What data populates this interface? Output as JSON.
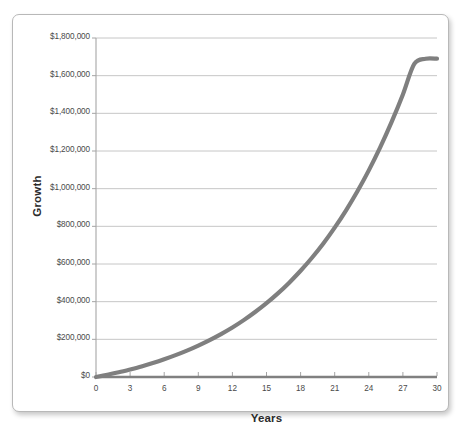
{
  "chart_data": {
    "type": "line",
    "title": "",
    "xlabel": "Years",
    "ylabel": "Growth",
    "xlim": [
      0,
      30
    ],
    "ylim": [
      0,
      1800000
    ],
    "grid": true,
    "legend": false,
    "x_ticks": [
      "0",
      "3",
      "6",
      "9",
      "12",
      "15",
      "18",
      "21",
      "24",
      "27",
      "30"
    ],
    "x_tick_values": [
      0,
      3,
      6,
      9,
      12,
      15,
      18,
      21,
      24,
      27,
      30
    ],
    "y_ticks": [
      "$0",
      "$200,000",
      "$400,000",
      "$600,000",
      "$800,000",
      "$1,000,000",
      "$1,200,000",
      "$1,400,000",
      "$1,600,000",
      "$1,800,000"
    ],
    "y_tick_values": [
      0,
      200000,
      400000,
      600000,
      800000,
      1000000,
      1200000,
      1400000,
      1600000,
      1800000
    ],
    "series": [
      {
        "name": "Growth",
        "color": "#7f7f7f",
        "x": [
          0,
          1,
          2,
          3,
          4,
          5,
          6,
          7,
          8,
          9,
          10,
          11,
          12,
          13,
          14,
          15,
          16,
          17,
          18,
          19,
          20,
          21,
          22,
          23,
          24,
          25,
          26,
          27,
          28,
          29,
          30
        ],
        "values": [
          0,
          12000,
          25000,
          40000,
          56000,
          74000,
          94000,
          116000,
          140000,
          167000,
          196000,
          228000,
          263000,
          302000,
          345000,
          392000,
          444000,
          501000,
          564000,
          633000,
          709000,
          793000,
          885000,
          986000,
          1097000,
          1219000,
          1353000,
          1500000,
          1662000,
          1690000,
          1690000
        ]
      }
    ]
  },
  "axis": {
    "y_title": "Growth",
    "x_title": "Years"
  },
  "colors": {
    "line": "#7f7f7f",
    "gridline": "#bfbfbf",
    "axis": "#808080",
    "frame_border": "#b8b8b8",
    "background": "#ffffff",
    "tick_text": "#4a4a4a",
    "title_text": "#2b2b2b"
  }
}
